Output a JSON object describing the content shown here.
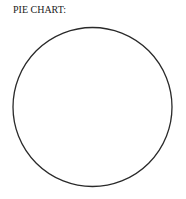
{
  "title": "PIE CHART:",
  "colors": {
    "outline": "#2a2a2a",
    "background": "#ffffff",
    "text": "#222222"
  },
  "chart_data": {
    "type": "pie",
    "title": "PIE CHART:",
    "categories": [],
    "values": [],
    "slices": [],
    "legend": null,
    "annotations": [],
    "note": "Empty pie outline only; no slices, labels, or legend shown",
    "center": [
      92.5,
      107
    ],
    "radius": 80
  }
}
